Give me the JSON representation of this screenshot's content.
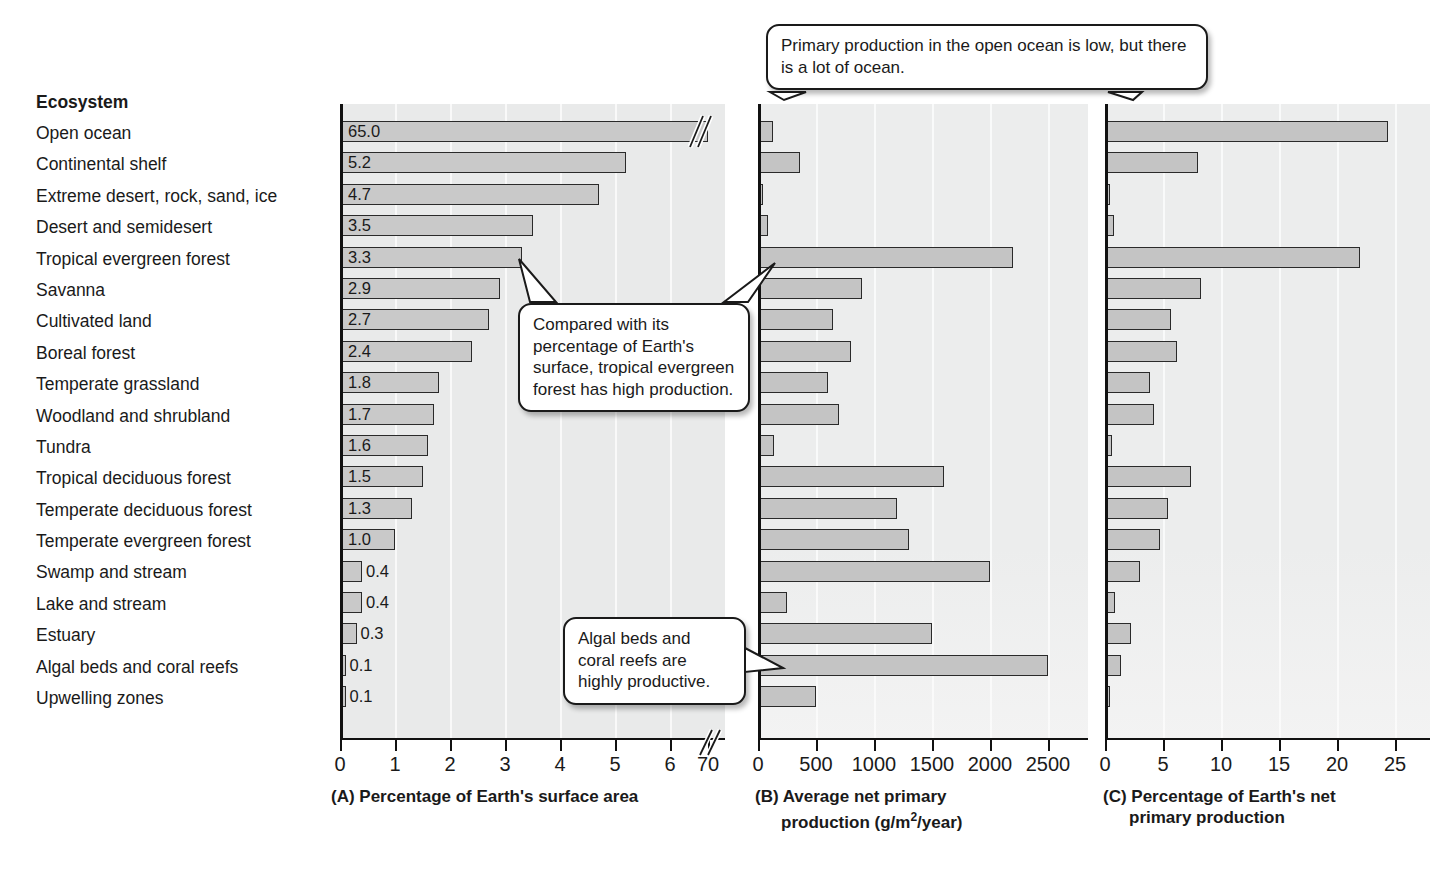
{
  "table": {
    "header": "Ecosystem",
    "ecosystems": [
      "Open ocean",
      "Continental shelf",
      "Extreme desert, rock, sand, ice",
      "Desert and semidesert",
      "Tropical evergreen forest",
      "Savanna",
      "Cultivated land",
      "Boreal forest",
      "Temperate grassland",
      "Woodland and shrubland",
      "Tundra",
      "Tropical deciduous forest",
      "Temperate deciduous forest",
      "Temperate evergreen forest",
      "Swamp and stream",
      "Lake and stream",
      "Estuary",
      "Algal beds and coral reefs",
      "Upwelling zones"
    ]
  },
  "callouts": [
    {
      "name": "open-ocean-callout",
      "text": "Primary production in the open ocean is low, but there is a lot of ocean."
    },
    {
      "name": "tropical-forest-callout",
      "text": "Compared with its percentage of Earth's surface, tropical evergreen forest has high production."
    },
    {
      "name": "algal-beds-callout",
      "text": "Algal beds and coral reefs are highly productive."
    }
  ],
  "panelA": {
    "caption": "(A) Percentage of Earth's surface area",
    "tick_labels": [
      "0",
      "1",
      "2",
      "3",
      "4",
      "5",
      "6",
      "70"
    ],
    "axis_break": "//",
    "value_labels": [
      "65.0",
      "5.2",
      "4.7",
      "3.5",
      "3.3",
      "2.9",
      "2.7",
      "2.4",
      "1.8",
      "1.7",
      "1.6",
      "1.5",
      "1.3",
      "1.0",
      "0.4",
      "0.4",
      "0.3",
      "0.1",
      "0.1"
    ]
  },
  "panelB": {
    "caption_line1": "(B) Average net primary",
    "caption_line2": "production (g/m",
    "caption_sup": "2",
    "caption_line2b": "/year)",
    "tick_labels": [
      "0",
      "500",
      "1000",
      "1500",
      "2000",
      "2500"
    ]
  },
  "panelC": {
    "caption_line1": "(C) Percentage of Earth's net",
    "caption_line2": "primary production",
    "tick_labels": [
      "0",
      "5",
      "10",
      "15",
      "20",
      "25"
    ]
  },
  "colors": {
    "bar_fill": "#c9c9c9",
    "bar_stroke": "#2a2a2a",
    "panel_bg": "#e9eaea",
    "text": "#1a1a1a"
  },
  "chart_data": [
    {
      "type": "bar",
      "orientation": "horizontal",
      "panel": "A",
      "title": "(A) Percentage of Earth's surface area",
      "xlabel": "",
      "ylabel": "Ecosystem",
      "xlim": [
        0,
        7
      ],
      "axis_break_after": 6,
      "axis_break_max": 70,
      "grid": true,
      "categories": [
        "Open ocean",
        "Continental shelf",
        "Extreme desert, rock, sand, ice",
        "Desert and semidesert",
        "Tropical evergreen forest",
        "Savanna",
        "Cultivated land",
        "Boreal forest",
        "Temperate grassland",
        "Woodland and shrubland",
        "Tundra",
        "Tropical deciduous forest",
        "Temperate deciduous forest",
        "Temperate evergreen forest",
        "Swamp and stream",
        "Lake and stream",
        "Estuary",
        "Algal beds and coral reefs",
        "Upwelling zones"
      ],
      "values": [
        65.0,
        5.2,
        4.7,
        3.5,
        3.3,
        2.9,
        2.7,
        2.4,
        1.8,
        1.7,
        1.6,
        1.5,
        1.3,
        1.0,
        0.4,
        0.4,
        0.3,
        0.1,
        0.1
      ],
      "data_labels": [
        "65.0",
        "5.2",
        "4.7",
        "3.5",
        "3.3",
        "2.9",
        "2.7",
        "2.4",
        "1.8",
        "1.7",
        "1.6",
        "1.5",
        "1.3",
        "1.0",
        "0.4",
        "0.4",
        "0.3",
        "0.1",
        "0.1"
      ]
    },
    {
      "type": "bar",
      "orientation": "horizontal",
      "panel": "B",
      "title": "(B) Average net primary production (g/m2/year)",
      "xlabel": "g/m2/year",
      "ylabel": "Ecosystem",
      "xlim": [
        0,
        2700
      ],
      "grid": true,
      "categories": [
        "Open ocean",
        "Continental shelf",
        "Extreme desert, rock, sand, ice",
        "Desert and semidesert",
        "Tropical evergreen forest",
        "Savanna",
        "Cultivated land",
        "Boreal forest",
        "Temperate grassland",
        "Woodland and shrubland",
        "Tundra",
        "Tropical deciduous forest",
        "Temperate deciduous forest",
        "Temperate evergreen forest",
        "Swamp and stream",
        "Lake and stream",
        "Estuary",
        "Algal beds and coral reefs",
        "Upwelling zones"
      ],
      "values": [
        125,
        360,
        3,
        90,
        2200,
        900,
        650,
        800,
        600,
        700,
        140,
        1600,
        1200,
        1300,
        2000,
        250,
        1500,
        2500,
        500
      ]
    },
    {
      "type": "bar",
      "orientation": "horizontal",
      "panel": "C",
      "title": "(C) Percentage of Earth's net primary production",
      "xlabel": "",
      "ylabel": "Ecosystem",
      "xlim": [
        0,
        26
      ],
      "grid": true,
      "categories": [
        "Open ocean",
        "Continental shelf",
        "Extreme desert, rock, sand, ice",
        "Desert and semidesert",
        "Tropical evergreen forest",
        "Savanna",
        "Cultivated land",
        "Boreal forest",
        "Temperate grassland",
        "Woodland and shrubland",
        "Tundra",
        "Tropical deciduous forest",
        "Temperate deciduous forest",
        "Temperate evergreen forest",
        "Swamp and stream",
        "Lake and stream",
        "Estuary",
        "Algal beds and coral reefs",
        "Upwelling zones"
      ],
      "values": [
        24.4,
        8.0,
        0.1,
        0.8,
        22.0,
        8.3,
        5.7,
        6.2,
        3.9,
        4.2,
        0.6,
        7.4,
        5.4,
        4.7,
        3.0,
        0.9,
        2.2,
        1.4,
        0.4
      ]
    }
  ]
}
